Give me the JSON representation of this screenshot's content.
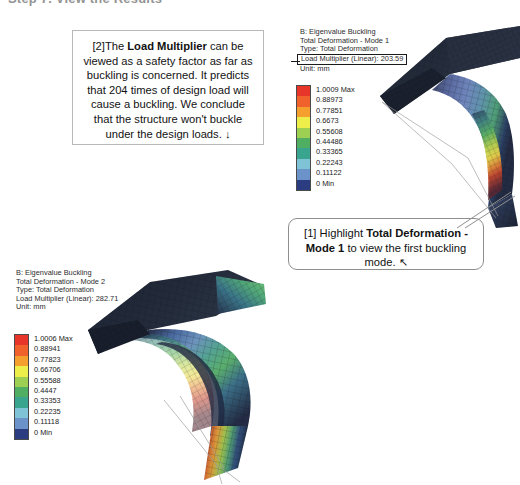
{
  "page": {
    "heading": "Step 7. View the Results"
  },
  "results": [
    {
      "id": "mode-1",
      "analysis": "B: Eigenvalue Buckling",
      "result_name": "Total Deformation - Mode 1",
      "type": "Type: Total Deformation",
      "load_multiplier_label": "Load Multiplier (Linear): 203.59",
      "unit": "Unit: mm",
      "legend_values": [
        "1.0009 Max",
        "0.88973",
        "0.77851",
        "0.6673",
        "0.55608",
        "0.44486",
        "0.33365",
        "0.22243",
        "0.11122",
        "0 Min"
      ],
      "legend_colors": [
        "#e8352a",
        "#f0612c",
        "#f5a02e",
        "#eeee4a",
        "#9ccf52",
        "#4fae62",
        "#3aa58e",
        "#7fc4d6",
        "#6b93c9",
        "#2b3c80"
      ]
    },
    {
      "id": "mode-2",
      "analysis": "B: Eigenvalue Buckling",
      "result_name": "Total Deformation - Mode 2",
      "type": "Type: Total Deformation",
      "load_multiplier_label": "Load Multiplier (Linear): 282.71",
      "unit": "Unit: mm",
      "legend_values": [
        "1.0006 Max",
        "0.88941",
        "0.77823",
        "0.66706",
        "0.55588",
        "0.4447",
        "0.33353",
        "0.22235",
        "0.11118",
        "0 Min"
      ],
      "legend_colors": [
        "#e8352a",
        "#f0612c",
        "#f5a02e",
        "#eeee4a",
        "#9ccf52",
        "#4fae62",
        "#3aa58e",
        "#7fc4d6",
        "#6b93c9",
        "#2b3c80"
      ]
    }
  ],
  "callouts": {
    "load_multiplier": {
      "index": "[2]",
      "line1_pre": "The ",
      "line1_bold": "Load Multiplier",
      "line1_post": " can be",
      "body": "viewed as a safety factor as far as buckling is concerned. It predicts that 204 times of design load will cause a buckling. We conclude that the structure won't buckle under the design loads.",
      "arrow": "↓"
    },
    "highlight_mode1": {
      "index": "[1]",
      "pre": "Highlight ",
      "bold": "Total Deformation - Mode 1",
      "post": " to view the first buckling mode.",
      "arrow": "↖"
    }
  }
}
